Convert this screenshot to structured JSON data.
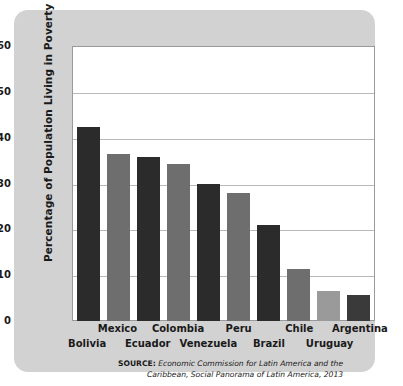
{
  "chart_data": {
    "type": "bar",
    "title": "",
    "xlabel": "",
    "ylabel": "Percentage of Population Living in Poverty",
    "ylim": [
      0,
      60
    ],
    "yticks": [
      60,
      50,
      40,
      30,
      20,
      10,
      0
    ],
    "grid": true,
    "legend": "none",
    "categories": [
      "Bolivia",
      "Mexico",
      "Ecuador",
      "Colombia",
      "Venezuela",
      "Peru",
      "Brazil",
      "Chile",
      "Uruguay",
      "Argentina"
    ],
    "values": [
      42.3,
      36.5,
      35.7,
      34.3,
      29.8,
      28.0,
      21.0,
      11.3,
      6.5,
      5.7
    ],
    "bar_colors": [
      "#2b2b2b",
      "#6e6e6e",
      "#2b2b2b",
      "#6e6e6e",
      "#2b2b2b",
      "#6e6e6e",
      "#2b2b2b",
      "#6e6e6e",
      "#9a9a9a",
      "#3a3a3a"
    ],
    "label_rows": [
      "bottom",
      "top",
      "bottom",
      "top",
      "bottom",
      "top",
      "bottom",
      "top",
      "bottom",
      "top"
    ]
  },
  "source": {
    "label": "SOURCE:",
    "line1": "Economic Commission for Latin America and the",
    "line2": "Caribbean, Social Panorama of Latin America, 2013"
  },
  "colors": {
    "card_background": "#d2d2d2",
    "plot_background": "#ffffff",
    "gridline": "#b9b9b9",
    "text": "#1a1a1a"
  }
}
